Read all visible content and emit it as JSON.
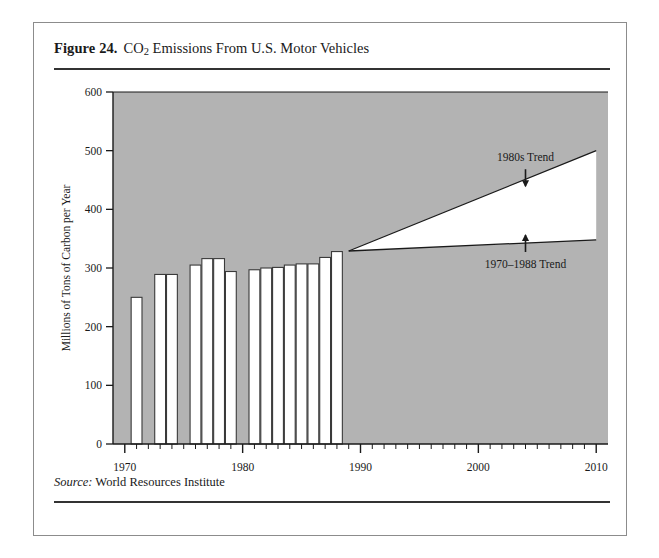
{
  "figure": {
    "number": "Figure 24.",
    "title_before_sub": "CO",
    "title_sub": "2",
    "title_after_sub": " Emissions From U.S. Motor Vehicles",
    "source_label": "Source:",
    "source_value": "World Resources Institute"
  },
  "colors": {
    "plot_background": "#b3b3b3",
    "bar_fill": "#ffffff",
    "bar_stroke": "#3a3a3a",
    "axis": "#1a1a1a",
    "wedge_fill": "#ffffff",
    "card_border": "#8c8c8c",
    "text": "#1a1a1a"
  },
  "chart_data": {
    "type": "bar",
    "title": "CO2 Emissions From U.S. Motor Vehicles",
    "xlabel": "",
    "ylabel": "Millions of Tons of Carbon per Year",
    "xlim": [
      1969,
      2011
    ],
    "ylim": [
      0,
      600
    ],
    "yticks": [
      0,
      100,
      200,
      300,
      400,
      500,
      600
    ],
    "ytick_labels": [
      "0",
      "100",
      "200",
      "300",
      "400",
      "500",
      "600"
    ],
    "xticks": [
      1970,
      1980,
      1990,
      2000,
      2010
    ],
    "xtick_labels": [
      "1970",
      "1980",
      "1990",
      "2000",
      "2010"
    ],
    "minor_xtick_interval": 1,
    "grid": false,
    "legend": "none",
    "categories": [
      1971,
      1973,
      1974,
      1976,
      1977,
      1978,
      1979,
      1981,
      1982,
      1983,
      1984,
      1985,
      1986,
      1987,
      1988
    ],
    "values": [
      250,
      289,
      289,
      305,
      316,
      316,
      294,
      297,
      300,
      301,
      305,
      307,
      307,
      318,
      328
    ],
    "series": [
      {
        "name": "CO2 emissions from U.S. motor vehicles",
        "values": [
          250,
          289,
          289,
          305,
          316,
          316,
          294,
          297,
          300,
          301,
          305,
          307,
          307,
          318,
          328
        ]
      }
    ],
    "projections": [
      {
        "name": "1980s Trend",
        "label": "1980s Trend",
        "x": [
          1989,
          2010
        ],
        "y": [
          329,
          500
        ]
      },
      {
        "name": "1970-1988 Trend",
        "label": "1970–1988 Trend",
        "x": [
          1989,
          2010
        ],
        "y": [
          329,
          348
        ]
      }
    ],
    "annotations": [
      {
        "text": "1980s Trend",
        "x": 2004,
        "y": 482,
        "arrow": "down"
      },
      {
        "text": "1970–1988 Trend",
        "x": 2004,
        "y": 300,
        "arrow": "up"
      }
    ]
  }
}
